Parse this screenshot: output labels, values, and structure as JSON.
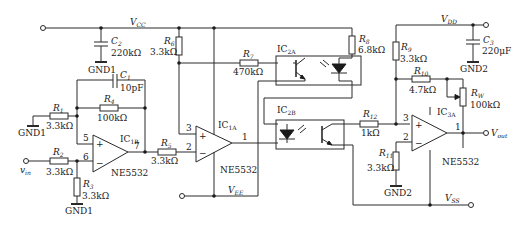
{
  "rails": {
    "vcc": {
      "main": "V",
      "sub": "CC"
    },
    "vee": {
      "main": "V",
      "sub": "EE"
    },
    "vdd": {
      "main": "V",
      "sub": "DD"
    },
    "vss": {
      "main": "V",
      "sub": "SS"
    },
    "vin": {
      "main": "v",
      "sub": "in"
    },
    "vout": {
      "main": "V",
      "sub": "out"
    }
  },
  "grounds": {
    "gnd1_a": "GND1",
    "gnd1_b": "GND1",
    "gnd1_c": "GND1",
    "gnd2_a": "GND2",
    "gnd2_b": "GND2"
  },
  "components": {
    "C1": {
      "main": "C",
      "sub": "1",
      "value": "10pF"
    },
    "C2": {
      "main": "C",
      "sub": "2",
      "value": "220kΩ"
    },
    "C3": {
      "main": "C",
      "sub": "3",
      "value": "220μF"
    },
    "R1": {
      "main": "R",
      "sub": "1",
      "value": "3.3kΩ"
    },
    "R2": {
      "main": "R",
      "sub": "2",
      "value": "3.3kΩ"
    },
    "R3": {
      "main": "R",
      "sub": "3",
      "value": "3.3kΩ"
    },
    "R4": {
      "main": "R",
      "sub": "4",
      "value": "100kΩ"
    },
    "R5": {
      "main": "R",
      "sub": "5",
      "value": "3.3kΩ"
    },
    "R6": {
      "main": "R",
      "sub": "6",
      "value": "3.3kΩ"
    },
    "R7": {
      "main": "R",
      "sub": "7",
      "value": "470kΩ"
    },
    "R8": {
      "main": "R",
      "sub": "8",
      "value": "6.8kΩ"
    },
    "R9": {
      "main": "R",
      "sub": "9",
      "value": "3.3kΩ"
    },
    "R10": {
      "main": "R",
      "sub": "10",
      "value": "4.7kΩ"
    },
    "R11": {
      "main": "R",
      "sub": "11",
      "value": "3.3kΩ"
    },
    "R12": {
      "main": "R",
      "sub": "12",
      "value": "1kΩ"
    },
    "RW": {
      "main": "R",
      "sub": "W",
      "value": "100kΩ"
    }
  },
  "ics": {
    "IC1B": {
      "main": "IC",
      "sub": "1B",
      "part": "NE5532",
      "pins": {
        "plus": "5",
        "minus": "6",
        "out": "7"
      }
    },
    "IC1A": {
      "main": "IC",
      "sub": "1A",
      "part": "NE5532",
      "pins": {
        "plus": "3",
        "minus": "2",
        "out": "1"
      }
    },
    "IC2A": {
      "main": "IC",
      "sub": "2A"
    },
    "IC2B": {
      "main": "IC",
      "sub": "2B"
    },
    "IC3A": {
      "main": "IC",
      "sub": "3A",
      "part": "NE5532",
      "pins": {
        "plus": "3",
        "minus": "2",
        "out": "1"
      }
    }
  },
  "symbols": {
    "plus": "+",
    "minus": "−"
  }
}
